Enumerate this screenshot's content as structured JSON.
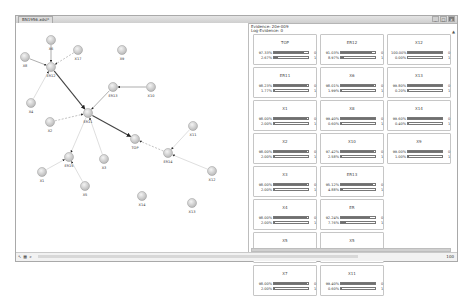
{
  "window": {
    "tab_title": "BN1956.xdsl*",
    "buttons": [
      "_",
      "□",
      "x"
    ]
  },
  "graph": {
    "nodes": [
      {
        "id": "X6",
        "x": 35,
        "y": 17
      },
      {
        "id": "X8",
        "x": 9,
        "y": 34
      },
      {
        "id": "X17",
        "x": 62,
        "y": 27
      },
      {
        "id": "X9",
        "x": 106,
        "y": 27
      },
      {
        "id": "ER12",
        "x": 35,
        "y": 44
      },
      {
        "id": "ER13",
        "x": 97,
        "y": 64
      },
      {
        "id": "X10",
        "x": 135,
        "y": 64
      },
      {
        "id": "X4",
        "x": 15,
        "y": 80
      },
      {
        "id": "X2",
        "x": 34,
        "y": 99
      },
      {
        "id": "ER11",
        "x": 72,
        "y": 90
      },
      {
        "id": "X11",
        "x": 177,
        "y": 103
      },
      {
        "id": "TOP",
        "x": 119,
        "y": 116
      },
      {
        "id": "ER14",
        "x": 152,
        "y": 130
      },
      {
        "id": "X3",
        "x": 88,
        "y": 136
      },
      {
        "id": "ER15",
        "x": 53,
        "y": 134
      },
      {
        "id": "X1",
        "x": 26,
        "y": 149
      },
      {
        "id": "X12",
        "x": 196,
        "y": 148
      },
      {
        "id": "X5",
        "x": 69,
        "y": 163
      },
      {
        "id": "X14",
        "x": 126,
        "y": 173
      },
      {
        "id": "X13",
        "x": 176,
        "y": 180
      }
    ],
    "edges": [
      {
        "from": "X8",
        "to": "ER12",
        "style": "solid"
      },
      {
        "from": "X6",
        "to": "ER12",
        "style": "solid"
      },
      {
        "from": "X17",
        "to": "ER12",
        "style": "dashed"
      },
      {
        "from": "ER12",
        "to": "ER11",
        "style": "bold"
      },
      {
        "from": "X4",
        "to": "ER12",
        "style": "faint"
      },
      {
        "from": "X10",
        "to": "ER13",
        "style": "solid"
      },
      {
        "from": "ER13",
        "to": "ER11",
        "style": "solid"
      },
      {
        "from": "X2",
        "to": "ER11",
        "style": "dashed"
      },
      {
        "from": "ER11",
        "to": "TOP",
        "style": "bold"
      },
      {
        "from": "ER11",
        "to": "ER15",
        "style": "faint"
      },
      {
        "from": "ER14",
        "to": "TOP",
        "style": "dashed"
      },
      {
        "from": "X11",
        "to": "ER14",
        "style": "faint"
      },
      {
        "from": "X3",
        "to": "ER11",
        "style": "faint"
      },
      {
        "from": "X1",
        "to": "ER15",
        "style": "faint"
      },
      {
        "from": "X5",
        "to": "ER15",
        "style": "faint"
      },
      {
        "from": "X12",
        "to": "ER14",
        "style": "faint"
      }
    ]
  },
  "panel": {
    "header1": "Evidence: 20e-009",
    "header2": "Log-Evidence: 0",
    "cards": [
      {
        "name": "TOP",
        "p1": "97.33%",
        "p2": "2.67%",
        "f1": 88,
        "f2": 12,
        "s1": "0",
        "s2": "1"
      },
      {
        "name": "ER12",
        "p1": "91.03%",
        "p2": "8.97%",
        "f1": 90,
        "f2": 10,
        "s1": "0",
        "s2": "1"
      },
      {
        "name": "X12",
        "p1": "100.00%",
        "p2": "0.00%",
        "f1": 100,
        "f2": 0,
        "s1": "0",
        "s2": "1"
      },
      {
        "name": "ER11",
        "p1": "98.23%",
        "p2": "1.77%",
        "f1": 98,
        "f2": 2,
        "s1": "0",
        "s2": "1"
      },
      {
        "name": "X6",
        "p1": "98.01%",
        "p2": "1.99%",
        "f1": 98,
        "f2": 2,
        "s1": "0",
        "s2": "1"
      },
      {
        "name": "X13",
        "p1": "99.80%",
        "p2": "0.20%",
        "f1": 99,
        "f2": 1,
        "s1": "0",
        "s2": "1"
      },
      {
        "name": "X1",
        "p1": "98.00%",
        "p2": "2.00%",
        "f1": 98,
        "f2": 2,
        "s1": "0",
        "s2": "1"
      },
      {
        "name": "X8",
        "p1": "99.40%",
        "p2": "0.60%",
        "f1": 99,
        "f2": 1,
        "s1": "0",
        "s2": "1"
      },
      {
        "name": "X14",
        "p1": "99.60%",
        "p2": "0.40%",
        "f1": 99,
        "f2": 1,
        "s1": "0",
        "s2": "1"
      },
      {
        "name": "X2",
        "p1": "98.00%",
        "p2": "2.00%",
        "f1": 98,
        "f2": 2,
        "s1": "0",
        "s2": "1"
      },
      {
        "name": "X10",
        "p1": "97.42%",
        "p2": "2.58%",
        "f1": 97,
        "f2": 3,
        "s1": "0",
        "s2": "1"
      },
      {
        "name": "X9",
        "p1": "99.00%",
        "p2": "1.00%",
        "f1": 99,
        "f2": 1,
        "s1": "0",
        "s2": "1"
      },
      {
        "name": "X3",
        "p1": "98.00%",
        "p2": "2.00%",
        "f1": 98,
        "f2": 2,
        "s1": "0",
        "s2": "1"
      },
      {
        "name": "ER13",
        "p1": "95.12%",
        "p2": "4.88%",
        "f1": 95,
        "f2": 5,
        "s1": "0",
        "s2": "1"
      },
      null,
      {
        "name": "X4",
        "p1": "98.00%",
        "p2": "2.00%",
        "f1": 98,
        "f2": 2,
        "s1": "0",
        "s2": "1"
      },
      {
        "name": "ER",
        "p1": "92.24%",
        "p2": "7.76%",
        "f1": 85,
        "f2": 15,
        "s1": "0",
        "s2": "1"
      },
      null,
      {
        "name": "X5",
        "p1": "99.40%",
        "p2": "0.60%",
        "f1": 99,
        "f2": 1,
        "s1": "0",
        "s2": "1"
      },
      {
        "name": "X5",
        "p1": "98.73%",
        "p2": "1.27%",
        "f1": 98,
        "f2": 2,
        "s1": "0",
        "s2": "1"
      },
      null,
      {
        "name": "X7",
        "p1": "98.00%",
        "p2": "2.00%",
        "f1": 98,
        "f2": 2,
        "s1": "0",
        "s2": "1"
      },
      {
        "name": "X11",
        "p1": "99.40%",
        "p2": "0.60%",
        "f1": 99,
        "f2": 1,
        "s1": "0",
        "s2": "1"
      }
    ]
  },
  "statusbar": {
    "icons": [
      "pointer-icon",
      "grid-icon",
      "arrow-icon"
    ],
    "zoom": "100"
  }
}
